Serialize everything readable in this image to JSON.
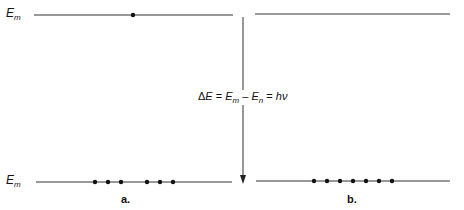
{
  "diagram": {
    "labels": {
      "upper_level": {
        "base": "E",
        "sub": "m"
      },
      "lower_level": {
        "base": "E",
        "sub": "m"
      }
    },
    "equation": {
      "delta": "Δ",
      "E1": "E",
      "eq1": " = ",
      "Em": "E",
      "m": "m",
      "minus": " – ",
      "En": "E",
      "n": "n",
      "eq2": " = ",
      "hv": "hν"
    },
    "panels": [
      {
        "label": "a.",
        "upper_dots": 1,
        "lower_dots": 6
      },
      {
        "label": "b.",
        "upper_dots": 0,
        "lower_dots": 7
      }
    ],
    "arrow_direction": "down",
    "colors": {
      "line": "#333333",
      "dot": "#111111"
    }
  }
}
